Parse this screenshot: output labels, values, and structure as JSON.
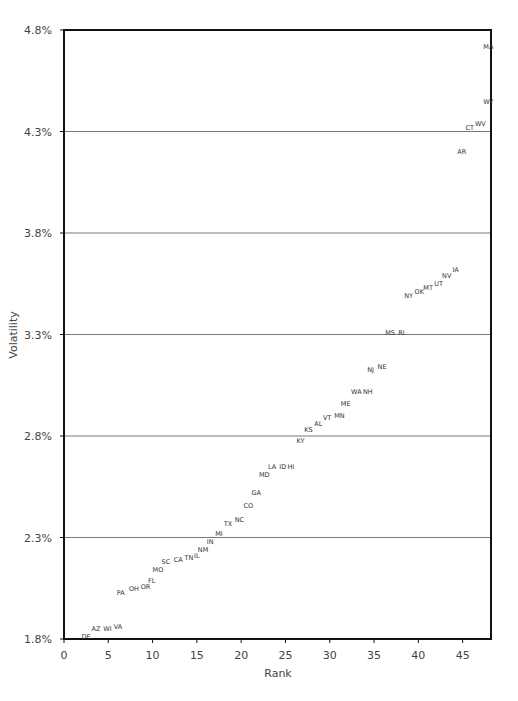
{
  "chart_data": {
    "type": "scatter",
    "title": "",
    "xlabel": "Rank",
    "ylabel": "Volatility",
    "xlim": [
      0,
      48.2
    ],
    "ylim": [
      1.8,
      4.8
    ],
    "x_ticks": [
      0,
      5,
      10,
      15,
      20,
      25,
      30,
      35,
      40,
      45
    ],
    "y_ticks": [
      "1.8%",
      "2.3%",
      "2.8%",
      "3.3%",
      "3.8%",
      "4.3%",
      "4.8%"
    ],
    "y_tick_values": [
      1.8,
      2.3,
      2.8,
      3.3,
      3.8,
      4.3,
      4.8
    ],
    "grid": "horizontal",
    "legend": "none",
    "marker": "text-label",
    "points": [
      {
        "label": "DE",
        "x": 2.5,
        "y": 1.81
      },
      {
        "label": "AZ",
        "x": 3.6,
        "y": 1.85
      },
      {
        "label": "WI",
        "x": 4.9,
        "y": 1.85
      },
      {
        "label": "VA",
        "x": 6.1,
        "y": 1.86
      },
      {
        "label": "PA",
        "x": 6.4,
        "y": 2.03
      },
      {
        "label": "OH",
        "x": 7.9,
        "y": 2.05
      },
      {
        "label": "OR",
        "x": 9.2,
        "y": 2.06
      },
      {
        "label": "FL",
        "x": 9.9,
        "y": 2.09
      },
      {
        "label": "MO",
        "x": 10.6,
        "y": 2.14
      },
      {
        "label": "SC",
        "x": 11.5,
        "y": 2.18
      },
      {
        "label": "CA",
        "x": 12.9,
        "y": 2.19
      },
      {
        "label": "TN",
        "x": 14.1,
        "y": 2.2
      },
      {
        "label": "IL",
        "x": 15.0,
        "y": 2.21
      },
      {
        "label": "NM",
        "x": 15.7,
        "y": 2.24
      },
      {
        "label": "IN",
        "x": 16.5,
        "y": 2.28
      },
      {
        "label": "MI",
        "x": 17.5,
        "y": 2.32
      },
      {
        "label": "TX",
        "x": 18.5,
        "y": 2.37
      },
      {
        "label": "NC",
        "x": 19.8,
        "y": 2.39
      },
      {
        "label": "CO",
        "x": 20.8,
        "y": 2.46
      },
      {
        "label": "GA",
        "x": 21.7,
        "y": 2.52
      },
      {
        "label": "MD",
        "x": 22.6,
        "y": 2.61
      },
      {
        "label": "LA",
        "x": 23.5,
        "y": 2.65
      },
      {
        "label": "ID",
        "x": 24.7,
        "y": 2.65
      },
      {
        "label": "HI",
        "x": 25.6,
        "y": 2.65
      },
      {
        "label": "KY",
        "x": 26.7,
        "y": 2.78
      },
      {
        "label": "KS",
        "x": 27.6,
        "y": 2.83
      },
      {
        "label": "AL",
        "x": 28.7,
        "y": 2.86
      },
      {
        "label": "VT",
        "x": 29.7,
        "y": 2.89
      },
      {
        "label": "MN",
        "x": 31.1,
        "y": 2.9
      },
      {
        "label": "ME",
        "x": 31.8,
        "y": 2.96
      },
      {
        "label": "WA",
        "x": 33.0,
        "y": 3.02
      },
      {
        "label": "NH",
        "x": 34.3,
        "y": 3.02
      },
      {
        "label": "NJ",
        "x": 34.6,
        "y": 3.13
      },
      {
        "label": "NE",
        "x": 35.9,
        "y": 3.14
      },
      {
        "label": "MS",
        "x": 36.8,
        "y": 3.31
      },
      {
        "label": "RI",
        "x": 38.1,
        "y": 3.31
      },
      {
        "label": "NY",
        "x": 38.9,
        "y": 3.49
      },
      {
        "label": "OK",
        "x": 40.1,
        "y": 3.51
      },
      {
        "label": "MT",
        "x": 41.1,
        "y": 3.53
      },
      {
        "label": "UT",
        "x": 42.3,
        "y": 3.55
      },
      {
        "label": "NV",
        "x": 43.2,
        "y": 3.59
      },
      {
        "label": "IA",
        "x": 44.2,
        "y": 3.62
      },
      {
        "label": "AR",
        "x": 44.9,
        "y": 4.2
      },
      {
        "label": "CT",
        "x": 45.8,
        "y": 4.32
      },
      {
        "label": "WV",
        "x": 47.0,
        "y": 4.34
      },
      {
        "label": "WY",
        "x": 47.9,
        "y": 4.45
      },
      {
        "label": "MA",
        "x": 47.9,
        "y": 4.72
      }
    ]
  },
  "colors": {
    "frame": "#111111",
    "gridline": "#555555",
    "text": "#444444"
  }
}
